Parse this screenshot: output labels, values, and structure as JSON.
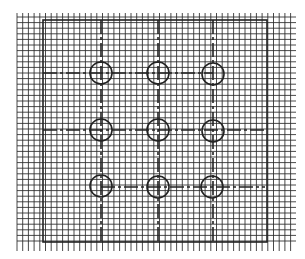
{
  "diagram": {
    "title": "",
    "background": "#ffffff",
    "line_color": "#222222",
    "grid": {
      "x_start": 17,
      "x_end": 296,
      "y_start": 13,
      "y_end": 248,
      "pitch_x": 5.7,
      "pitch_y": 5.6,
      "tick_overhang": 3
    },
    "border": {
      "left": 43,
      "top": 20,
      "right": 267,
      "bottom": 242
    },
    "columns_x": [
      101,
      158,
      213
    ],
    "rows_y": [
      73,
      130,
      187
    ],
    "circle_radius": 11,
    "circles": [
      {
        "row": 1,
        "col": 1,
        "cx": 101,
        "cy": 73
      },
      {
        "row": 1,
        "col": 2,
        "cx": 158,
        "cy": 73
      },
      {
        "row": 1,
        "col": 3,
        "cx": 213,
        "cy": 74
      },
      {
        "row": 2,
        "col": 1,
        "cx": 101,
        "cy": 130
      },
      {
        "row": 2,
        "col": 2,
        "cx": 158,
        "cy": 130
      },
      {
        "row": 2,
        "col": 3,
        "cx": 213,
        "cy": 131
      },
      {
        "row": 3,
        "col": 1,
        "cx": 101,
        "cy": 186
      },
      {
        "row": 3,
        "col": 2,
        "cx": 158,
        "cy": 187
      },
      {
        "row": 3,
        "col": 3,
        "cx": 212,
        "cy": 187
      }
    ],
    "center_lines": {
      "vertical": [
        {
          "x": 101,
          "y1": 20,
          "y2": 242
        },
        {
          "x": 158,
          "y1": 20,
          "y2": 242
        },
        {
          "x": 213,
          "y1": 20,
          "y2": 242
        }
      ],
      "horizontal": [
        {
          "y": 73,
          "x1": 43,
          "x2": 213
        },
        {
          "y": 130,
          "x1": 43,
          "x2": 267
        },
        {
          "y": 187,
          "x1": 101,
          "x2": 265
        }
      ]
    }
  }
}
